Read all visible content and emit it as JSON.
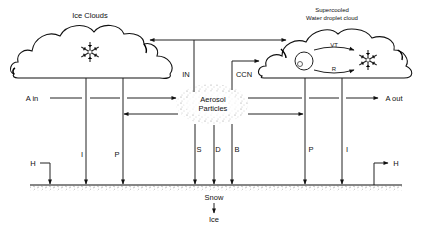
{
  "diagram": {
    "type": "atmospheric aerosol-cloud-snow interaction schematic",
    "ice_cloud": {
      "label": "Ice Clouds",
      "icon": "snowflake-icon"
    },
    "water_cloud": {
      "label_line1": "Supercooled",
      "label_line2": "Water droplet cloud",
      "droplet_icon": "droplet-circle-icon",
      "snowflake_icon": "snowflake-icon",
      "process_top": "VT",
      "process_bottom": "R"
    },
    "aerosol": {
      "label_line1": "Aerosol",
      "label_line2": "Particles"
    },
    "flows": {
      "in_label": "IN",
      "ccn_label": "CCN",
      "a_in_label": "A in",
      "a_out_label": "A out",
      "ice_cloud_left_flux": "I",
      "ice_cloud_right_flux": "P",
      "aerosol_flux_1": "S",
      "aerosol_flux_2": "D",
      "aerosol_flux_3": "B",
      "water_cloud_left_flux": "P",
      "water_cloud_right_flux": "I",
      "h_left": "H",
      "h_right": "H"
    },
    "surface": {
      "snow_label": "Snow",
      "ice_label": "Ice"
    }
  }
}
